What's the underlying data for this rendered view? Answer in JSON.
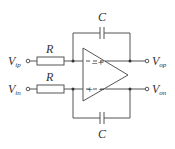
{
  "diagram": {
    "type": "fully-differential integrator circuit",
    "capacitor_top_label": "C",
    "capacitor_bottom_label": "C",
    "resistor_top_label": "R",
    "resistor_bottom_label": "R",
    "input_top": {
      "main": "V",
      "sub": "ip"
    },
    "input_bottom": {
      "main": "V",
      "sub": "in"
    },
    "output_top": {
      "main": "V",
      "sub": "op"
    },
    "output_bottom": {
      "main": "V",
      "sub": "on"
    },
    "opamp_top_input_sign": "−",
    "opamp_top_output_sign": "+",
    "opamp_bottom_input_sign": "+",
    "opamp_bottom_output_sign": "−"
  }
}
